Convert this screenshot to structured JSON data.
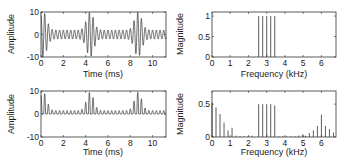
{
  "chart_data": [
    {
      "id": "top-left",
      "type": "line",
      "title": "",
      "xlabel": "Time (ms)",
      "ylabel": "Amplitude",
      "xlim": [
        0,
        11.2
      ],
      "ylim": [
        -10,
        10
      ],
      "xticks": [
        0,
        2,
        4,
        6,
        8,
        10
      ],
      "yticks": [
        -10,
        0,
        10
      ],
      "grid": false,
      "description": "Signal with beating bursts of ~10 amplitude near t=0.2, 4.4, 8.7 ms and small ~2 amplitude oscillations between",
      "burst_centers_ms": [
        0.2,
        4.4,
        8.7
      ],
      "burst_peak_amplitude": 10,
      "background_amplitude": 2
    },
    {
      "id": "top-right",
      "type": "bar",
      "title": "",
      "xlabel": "Frequency (kHz)",
      "ylabel": "Magnitude",
      "xlim": [
        0,
        6.8
      ],
      "ylim": [
        0,
        1.1
      ],
      "xticks": [
        0,
        1,
        2,
        3,
        4,
        5,
        6
      ],
      "yticks": [
        0,
        0.5,
        1
      ],
      "ytick_labels": [
        "0",
        "0.5",
        "1"
      ],
      "grid": false,
      "x": [
        2.56,
        2.78,
        3.0,
        3.22,
        3.44
      ],
      "values": [
        1,
        1,
        1,
        1,
        1
      ]
    },
    {
      "id": "bottom-left",
      "type": "line",
      "title": "",
      "xlabel": "Time (ms)",
      "ylabel": "Amplitude",
      "xlim": [
        0,
        11.2
      ],
      "ylim": [
        -10,
        10
      ],
      "xticks": [
        0,
        2,
        4,
        6,
        8,
        10
      ],
      "yticks": [
        -10,
        0,
        10
      ],
      "grid": false,
      "description": "Rectified (non-negative) signal: half-wave peaks up to ~10 at bursts near 0.2, 4.4, 8.7 ms, small ~1.5 peaks elsewhere",
      "burst_centers_ms": [
        0.2,
        4.4,
        8.7
      ],
      "burst_peak_amplitude": 9.5,
      "background_amplitude": 1.5
    },
    {
      "id": "bottom-right",
      "type": "bar",
      "title": "",
      "xlabel": "Frequency (kHz)",
      "ylabel": "Magnitude",
      "xlim": [
        0,
        6.8
      ],
      "ylim": [
        0,
        0.7
      ],
      "xticks": [
        0,
        1,
        2,
        3,
        4,
        5,
        6
      ],
      "yticks": [
        0,
        0.5
      ],
      "ytick_labels": [
        "0",
        "0.5"
      ],
      "grid": false,
      "x": [
        0.0,
        0.22,
        0.44,
        0.66,
        0.88,
        1.1,
        1.32,
        1.54,
        1.76,
        1.98,
        2.2,
        2.56,
        2.78,
        3.0,
        3.22,
        3.44,
        3.66,
        3.88,
        4.1,
        4.32,
        4.54,
        4.76,
        4.98,
        5.12,
        5.34,
        5.56,
        5.78,
        6.0,
        6.22,
        6.44,
        6.66
      ],
      "values": [
        0.52,
        0.45,
        0.35,
        0.22,
        0.1,
        0.14,
        0.02,
        0.01,
        0.01,
        0.01,
        0.02,
        0.5,
        0.5,
        0.5,
        0.5,
        0.48,
        0.01,
        0.01,
        0.01,
        0.01,
        0.01,
        0.02,
        0.04,
        0.02,
        0.06,
        0.1,
        0.17,
        0.34,
        0.17,
        0.12,
        0.07
      ]
    }
  ],
  "labels": {
    "time_axis": "Time (ms)",
    "freq_axis": "Frequency (kHz)",
    "amplitude_axis": "Amplitude",
    "magnitude_axis": "Magnitude"
  }
}
